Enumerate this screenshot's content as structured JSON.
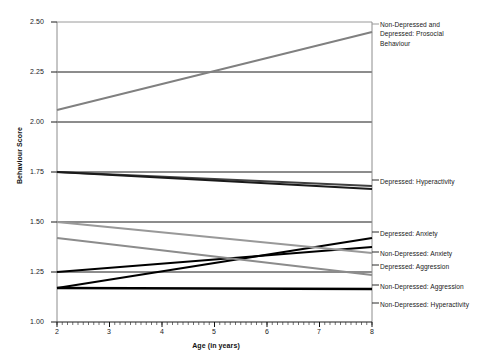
{
  "chart_data": {
    "type": "line",
    "title": "",
    "xlabel": "Age (in years)",
    "ylabel": "Behaviour Score",
    "xlim": [
      2,
      8
    ],
    "ylim": [
      1.0,
      2.5
    ],
    "xticks": [
      "2",
      "3",
      "4",
      "5",
      "6",
      "7",
      "8"
    ],
    "yticks": [
      "1.00",
      "1.25",
      "1.50",
      "1.75",
      "2.00",
      "2.25",
      "2.50"
    ],
    "grid": "horizontal",
    "legend_position": "right-inline",
    "x": [
      2,
      8
    ],
    "series": [
      {
        "name": "Non-Depressed and Depressed: Prosocial Behaviour",
        "label": "Non-Depressed and\nDepressed: Prosocial\nBehaviour",
        "values": [
          2.06,
          2.45
        ],
        "color": "#808080",
        "width": 1.9
      },
      {
        "name": "Depressed: Hyperactivity",
        "label": "Depressed: Hyperactivity",
        "values": [
          1.75,
          1.68
        ],
        "color": "#404040",
        "width": 2.0
      },
      {
        "name": "Non-Depressed: Hyperactivity",
        "label": "Non-Depressed: Hyperactivity",
        "values": [
          1.75,
          1.665
        ],
        "color": "#1a1a1a",
        "width": 2.0
      },
      {
        "name": "Depressed: Anxiety",
        "label": "Depressed: Anxiety",
        "values": [
          1.17,
          1.42
        ],
        "color": "#000000",
        "width": 2.2
      },
      {
        "name": "Non-Depressed: Anxiety",
        "label": "Non-Depressed: Anxiety",
        "values": [
          1.25,
          1.375
        ],
        "color": "#000000",
        "width": 2.2
      },
      {
        "name": "Depressed: Aggression",
        "label": "Depressed: Aggression",
        "values": [
          1.5,
          1.345
        ],
        "color": "#999999",
        "width": 1.9
      },
      {
        "name": "Non-Depressed: Aggression",
        "label": "Non-Depressed: Aggression",
        "values": [
          1.42,
          1.235
        ],
        "color": "#8c8c8c",
        "width": 1.9
      },
      {
        "name": "Non-Depressed: Hyperactivity (lower)",
        "label": "Non-Depressed: Hyperactivity",
        "values": [
          1.17,
          1.165
        ],
        "color": "#000000",
        "width": 2.4,
        "hide_label": true
      }
    ],
    "labels_at_right": [
      {
        "text": "Non-Depressed and\nDepressed: Prosocial\nBehaviour",
        "y_px": 24
      },
      {
        "text": "Depressed: Hyperactivity",
        "y_px": 180
      },
      {
        "text": "Depressed: Anxiety",
        "y_px": 232
      },
      {
        "text": "Non-Depressed: Anxiety",
        "y_px": 252
      },
      {
        "text": "Depressed: Aggression",
        "y_px": 265
      },
      {
        "text": "Non-Depressed: Aggression",
        "y_px": 285
      },
      {
        "text": "Non-Depressed: Hyperactivity",
        "y_px": 303
      }
    ]
  },
  "axes": {
    "ylabel": "Behaviour Score",
    "xlabel": "Age (in years)",
    "yticks": [
      "2.50",
      "2.25",
      "2.00",
      "1.75",
      "1.50",
      "1.25",
      "1.00"
    ],
    "xticks": [
      "2",
      "3",
      "4",
      "5",
      "6",
      "7",
      "8"
    ]
  }
}
